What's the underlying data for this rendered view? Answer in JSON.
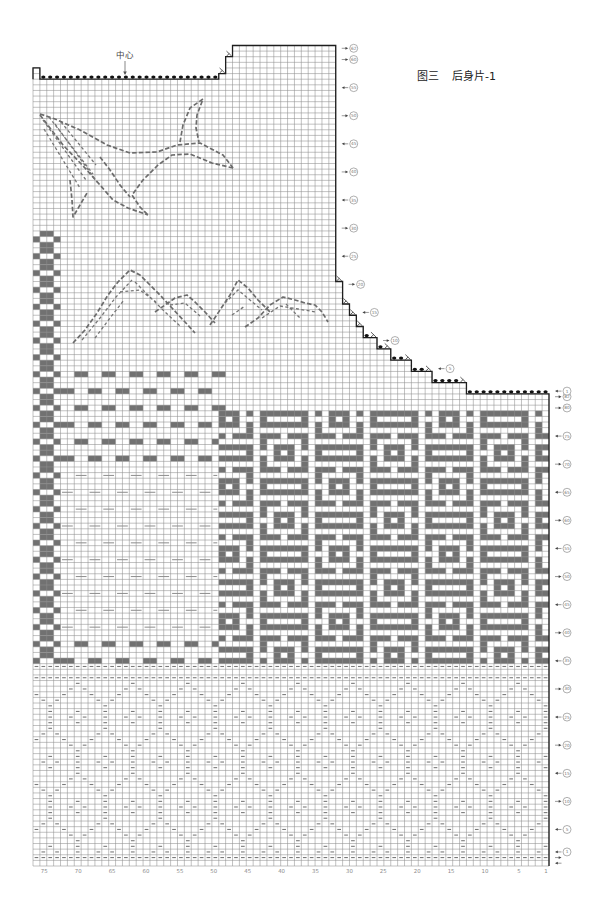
{
  "figure": {
    "number": "图三",
    "title": "后身片-1"
  },
  "center_label": "中心",
  "colors": {
    "dark_stitch": "#717171",
    "grid_line": "#8f8f8f",
    "outline": "#1e1e1e",
    "purl_mark": "#7a7a7a",
    "light_mark": "#8c8c8c",
    "bind_off_dot": "#111111",
    "label": "#808080"
  },
  "column_labels": [
    "75",
    "70",
    "65",
    "60",
    "55",
    "50",
    "45",
    "40",
    "35",
    "30",
    "25",
    "20",
    "15",
    "10",
    "5",
    "1"
  ],
  "row_labels": {
    "body_row1_index": 2,
    "armhole_row1_index": 84,
    "body": [
      {
        "n": "1",
        "dir": "left"
      },
      {
        "n": "5",
        "dir": "left"
      },
      {
        "n": "10",
        "dir": "right"
      },
      {
        "n": "15",
        "dir": "left"
      },
      {
        "n": "20",
        "dir": "right"
      },
      {
        "n": "25",
        "dir": "left"
      },
      {
        "n": "30",
        "dir": "right"
      },
      {
        "n": "35",
        "dir": "left"
      },
      {
        "n": "40",
        "dir": "right"
      },
      {
        "n": "45",
        "dir": "left"
      },
      {
        "n": "50",
        "dir": "right"
      },
      {
        "n": "55",
        "dir": "left"
      },
      {
        "n": "60",
        "dir": "right"
      },
      {
        "n": "65",
        "dir": "left"
      },
      {
        "n": "70",
        "dir": "right"
      },
      {
        "n": "75",
        "dir": "left"
      },
      {
        "n": "80",
        "dir": "right"
      },
      {
        "n": "82",
        "dir": "right"
      }
    ],
    "body_extra_arrows": [
      {
        "row_index": 1,
        "dir": "right"
      },
      {
        "row_index": 0,
        "dir": "left"
      }
    ],
    "armhole": [
      {
        "n": "1",
        "dir": "left"
      },
      {
        "n": "5",
        "dir": "left"
      },
      {
        "n": "10",
        "dir": "right"
      },
      {
        "n": "15",
        "dir": "left"
      },
      {
        "n": "20",
        "dir": "right"
      },
      {
        "n": "25",
        "dir": "left"
      },
      {
        "n": "30",
        "dir": "right"
      },
      {
        "n": "35",
        "dir": "left"
      },
      {
        "n": "40",
        "dir": "right"
      },
      {
        "n": "45",
        "dir": "left"
      },
      {
        "n": "50",
        "dir": "right"
      },
      {
        "n": "55",
        "dir": "left"
      },
      {
        "n": "60",
        "dir": "right"
      },
      {
        "n": "62",
        "dir": "right"
      }
    ]
  },
  "chart": {
    "stitches": 75,
    "rows": 146,
    "column_tops": [
      {
        "cols": [
          1,
          12
        ],
        "top": 84
      },
      {
        "cols": [
          13,
          17
        ],
        "top": 86
      },
      {
        "cols": [
          18,
          20
        ],
        "top": 88
      },
      {
        "cols": [
          21,
          23
        ],
        "top": 90
      },
      {
        "cols": [
          24,
          25
        ],
        "top": 92
      },
      {
        "cols": [
          26,
          27
        ],
        "top": 94
      },
      {
        "cols": [
          28,
          28
        ],
        "top": 96
      },
      {
        "cols": [
          29,
          29
        ],
        "top": 98
      },
      {
        "cols": [
          30,
          30
        ],
        "top": 100
      },
      {
        "cols": [
          31,
          31
        ],
        "top": 104
      },
      {
        "cols": [
          32,
          46
        ],
        "top": 146
      },
      {
        "cols": [
          47,
          47
        ],
        "top": 144
      },
      {
        "cols": [
          48,
          48
        ],
        "top": 141
      },
      {
        "cols": [
          49,
          74
        ],
        "top": 140
      },
      {
        "cols": [
          75,
          75
        ],
        "top": 142
      }
    ],
    "shaping_marks": [
      {
        "row": 84,
        "dots": [
          1,
          12
        ]
      },
      {
        "row": 86,
        "dots": [
          14,
          17
        ],
        "dec": 13
      },
      {
        "row": 88,
        "dots": [
          19,
          20
        ],
        "dec": 18
      },
      {
        "row": 90,
        "dots": [
          22,
          23
        ],
        "dec": 21
      },
      {
        "row": 92,
        "dots": [
          25,
          25
        ],
        "dec": 24
      },
      {
        "row": 94,
        "dots": [
          27,
          27
        ],
        "dec": 26
      },
      {
        "row": 96,
        "dec": 28
      },
      {
        "row": 98,
        "dec": 29
      },
      {
        "row": 100,
        "dec": 30
      },
      {
        "row": 104,
        "dec": 31
      },
      {
        "row": 140,
        "dots": [
          49,
          74
        ]
      },
      {
        "row": 141,
        "dec": 48
      },
      {
        "row": 144,
        "dec": 47
      }
    ],
    "motifs": {
      "geometric": {
        "cols": [
          1,
          48
        ],
        "rows": [
          36,
          80
        ]
      },
      "brick": {
        "cols": [
          48,
          71
        ],
        "reference_row": 87,
        "dark_rows": [
          36,
          39,
          72,
          75,
          78,
          81,
          84,
          87
        ],
        "light_rows": [
          42,
          45,
          48,
          51,
          54,
          57,
          60,
          63,
          66,
          69
        ]
      },
      "zigzag": {
        "cols": [
          72,
          75
        ],
        "rows": [
          36,
          112
        ]
      },
      "purl_rows": [
        1,
        33,
        35
      ],
      "diamond_purl": {
        "rows": [
          2,
          32
        ]
      }
    }
  }
}
